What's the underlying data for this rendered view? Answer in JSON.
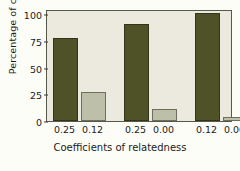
{
  "chart_data": {
    "type": "bar",
    "title": "",
    "xlabel": "Coefficients of relatedness",
    "ylabel": "Percentage of choices",
    "categories": [
      "0.25",
      "0.12",
      "0.25",
      "0.00",
      "0.12",
      "0.00"
    ],
    "values": [
      78,
      27,
      91,
      11,
      101,
      4
    ],
    "bar_colors": [
      "#4e5226",
      "#bdbfa8",
      "#4e5226",
      "#bdbfa8",
      "#4e5226",
      "#bdbfa8"
    ],
    "series": [
      {
        "name": "Percentage of choices",
        "values": [
          78,
          27,
          91,
          11,
          101,
          4
        ]
      }
    ],
    "pairs": [
      {
        "left_label": "0.25",
        "left_value": 78,
        "right_label": "0.12",
        "right_value": 27
      },
      {
        "left_label": "0.25",
        "left_value": 91,
        "right_label": "0.00",
        "right_value": 11
      },
      {
        "left_label": "0.12",
        "left_value": 101,
        "right_label": "0.00",
        "right_value": 4
      }
    ],
    "ylim": [
      0,
      105
    ],
    "yticks": [
      0,
      25,
      50,
      75,
      100
    ],
    "ytick_labels": [
      "0",
      "25",
      "50",
      "75",
      "100"
    ],
    "grid": false,
    "legend": "none",
    "colors": {
      "bar_dark": "#4e5226",
      "bar_light": "#bdbfa8",
      "plot_background": "#eceade",
      "frame": "#57574a",
      "text": "#1b1b1b"
    }
  }
}
